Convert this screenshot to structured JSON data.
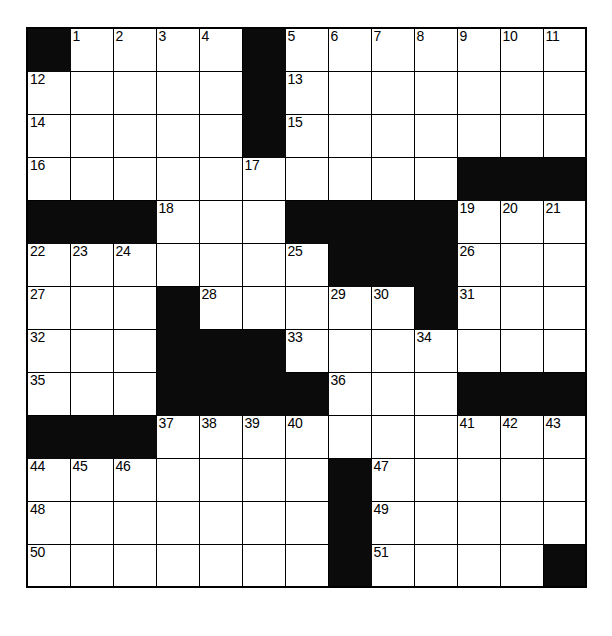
{
  "puzzle": {
    "type": "crossword-grid",
    "columns": 13,
    "rows": 13,
    "cell_size_px": 43,
    "colors": {
      "block": "#0b0b0b",
      "open": "#ffffff",
      "border": "#000000",
      "number_text": "#000000"
    },
    "max_number": 51,
    "numbers_present": [
      1,
      2,
      3,
      4,
      5,
      6,
      7,
      8,
      9,
      10,
      11,
      12,
      13,
      14,
      15,
      16,
      17,
      18,
      19,
      20,
      21,
      22,
      23,
      24,
      25,
      26,
      27,
      28,
      29,
      30,
      31,
      32,
      33,
      34,
      35,
      36,
      37,
      38,
      39,
      40,
      41,
      42,
      43,
      44,
      45,
      46,
      47,
      48,
      49,
      50,
      51
    ],
    "grid": [
      [
        {
          "block": true,
          "num": null
        },
        {
          "block": false,
          "num": "1"
        },
        {
          "block": false,
          "num": "2"
        },
        {
          "block": false,
          "num": "3"
        },
        {
          "block": false,
          "num": "4"
        },
        {
          "block": true,
          "num": null
        },
        {
          "block": false,
          "num": "5"
        },
        {
          "block": false,
          "num": "6"
        },
        {
          "block": false,
          "num": "7"
        },
        {
          "block": false,
          "num": "8"
        },
        {
          "block": false,
          "num": "9"
        },
        {
          "block": false,
          "num": "10"
        },
        {
          "block": false,
          "num": "11"
        }
      ],
      [
        {
          "block": false,
          "num": "12"
        },
        {
          "block": false,
          "num": null
        },
        {
          "block": false,
          "num": null
        },
        {
          "block": false,
          "num": null
        },
        {
          "block": false,
          "num": null
        },
        {
          "block": true,
          "num": null
        },
        {
          "block": false,
          "num": "13"
        },
        {
          "block": false,
          "num": null
        },
        {
          "block": false,
          "num": null
        },
        {
          "block": false,
          "num": null
        },
        {
          "block": false,
          "num": null
        },
        {
          "block": false,
          "num": null
        },
        {
          "block": false,
          "num": null
        }
      ],
      [
        {
          "block": false,
          "num": "14"
        },
        {
          "block": false,
          "num": null
        },
        {
          "block": false,
          "num": null
        },
        {
          "block": false,
          "num": null
        },
        {
          "block": false,
          "num": null
        },
        {
          "block": true,
          "num": null
        },
        {
          "block": false,
          "num": "15"
        },
        {
          "block": false,
          "num": null
        },
        {
          "block": false,
          "num": null
        },
        {
          "block": false,
          "num": null
        },
        {
          "block": false,
          "num": null
        },
        {
          "block": false,
          "num": null
        },
        {
          "block": false,
          "num": null
        }
      ],
      [
        {
          "block": false,
          "num": "16"
        },
        {
          "block": false,
          "num": null
        },
        {
          "block": false,
          "num": null
        },
        {
          "block": false,
          "num": null
        },
        {
          "block": false,
          "num": null
        },
        {
          "block": false,
          "num": "17"
        },
        {
          "block": false,
          "num": null
        },
        {
          "block": false,
          "num": null
        },
        {
          "block": false,
          "num": null
        },
        {
          "block": false,
          "num": null
        },
        {
          "block": true,
          "num": null
        },
        {
          "block": true,
          "num": null
        },
        {
          "block": true,
          "num": null
        }
      ],
      [
        {
          "block": true,
          "num": null
        },
        {
          "block": true,
          "num": null
        },
        {
          "block": true,
          "num": null
        },
        {
          "block": false,
          "num": "18"
        },
        {
          "block": false,
          "num": null
        },
        {
          "block": false,
          "num": null
        },
        {
          "block": true,
          "num": null
        },
        {
          "block": true,
          "num": null
        },
        {
          "block": true,
          "num": null
        },
        {
          "block": true,
          "num": null
        },
        {
          "block": false,
          "num": "19"
        },
        {
          "block": false,
          "num": "20"
        },
        {
          "block": false,
          "num": "21"
        }
      ],
      [
        {
          "block": false,
          "num": "22"
        },
        {
          "block": false,
          "num": "23"
        },
        {
          "block": false,
          "num": "24"
        },
        {
          "block": false,
          "num": null
        },
        {
          "block": false,
          "num": null
        },
        {
          "block": false,
          "num": null
        },
        {
          "block": false,
          "num": "25"
        },
        {
          "block": true,
          "num": null
        },
        {
          "block": true,
          "num": null
        },
        {
          "block": true,
          "num": null
        },
        {
          "block": false,
          "num": "26"
        },
        {
          "block": false,
          "num": null
        },
        {
          "block": false,
          "num": null
        }
      ],
      [
        {
          "block": false,
          "num": "27"
        },
        {
          "block": false,
          "num": null
        },
        {
          "block": false,
          "num": null
        },
        {
          "block": true,
          "num": null
        },
        {
          "block": false,
          "num": "28"
        },
        {
          "block": false,
          "num": null
        },
        {
          "block": false,
          "num": null
        },
        {
          "block": false,
          "num": "29"
        },
        {
          "block": false,
          "num": "30"
        },
        {
          "block": true,
          "num": null
        },
        {
          "block": false,
          "num": "31"
        },
        {
          "block": false,
          "num": null
        },
        {
          "block": false,
          "num": null
        }
      ],
      [
        {
          "block": false,
          "num": "32"
        },
        {
          "block": false,
          "num": null
        },
        {
          "block": false,
          "num": null
        },
        {
          "block": true,
          "num": null
        },
        {
          "block": true,
          "num": null
        },
        {
          "block": true,
          "num": null
        },
        {
          "block": false,
          "num": "33"
        },
        {
          "block": false,
          "num": null
        },
        {
          "block": false,
          "num": null
        },
        {
          "block": false,
          "num": "34"
        },
        {
          "block": false,
          "num": null
        },
        {
          "block": false,
          "num": null
        },
        {
          "block": false,
          "num": null
        }
      ],
      [
        {
          "block": false,
          "num": "35"
        },
        {
          "block": false,
          "num": null
        },
        {
          "block": false,
          "num": null
        },
        {
          "block": true,
          "num": null
        },
        {
          "block": true,
          "num": null
        },
        {
          "block": true,
          "num": null
        },
        {
          "block": true,
          "num": null
        },
        {
          "block": false,
          "num": "36"
        },
        {
          "block": false,
          "num": null
        },
        {
          "block": false,
          "num": null
        },
        {
          "block": true,
          "num": null
        },
        {
          "block": true,
          "num": null
        },
        {
          "block": true,
          "num": null
        }
      ],
      [
        {
          "block": true,
          "num": null
        },
        {
          "block": true,
          "num": null
        },
        {
          "block": true,
          "num": null
        },
        {
          "block": false,
          "num": "37"
        },
        {
          "block": false,
          "num": "38"
        },
        {
          "block": false,
          "num": "39"
        },
        {
          "block": false,
          "num": "40"
        },
        {
          "block": false,
          "num": null
        },
        {
          "block": false,
          "num": null
        },
        {
          "block": false,
          "num": null
        },
        {
          "block": false,
          "num": "41"
        },
        {
          "block": false,
          "num": "42"
        },
        {
          "block": false,
          "num": "43"
        }
      ],
      [
        {
          "block": false,
          "num": "44"
        },
        {
          "block": false,
          "num": "45"
        },
        {
          "block": false,
          "num": "46"
        },
        {
          "block": false,
          "num": null
        },
        {
          "block": false,
          "num": null
        },
        {
          "block": false,
          "num": null
        },
        {
          "block": false,
          "num": null
        },
        {
          "block": true,
          "num": null
        },
        {
          "block": false,
          "num": "47"
        },
        {
          "block": false,
          "num": null
        },
        {
          "block": false,
          "num": null
        },
        {
          "block": false,
          "num": null
        },
        {
          "block": false,
          "num": null
        }
      ],
      [
        {
          "block": false,
          "num": "48"
        },
        {
          "block": false,
          "num": null
        },
        {
          "block": false,
          "num": null
        },
        {
          "block": false,
          "num": null
        },
        {
          "block": false,
          "num": null
        },
        {
          "block": false,
          "num": null
        },
        {
          "block": false,
          "num": null
        },
        {
          "block": true,
          "num": null
        },
        {
          "block": false,
          "num": "49"
        },
        {
          "block": false,
          "num": null
        },
        {
          "block": false,
          "num": null
        },
        {
          "block": false,
          "num": null
        },
        {
          "block": false,
          "num": null
        }
      ],
      [
        {
          "block": false,
          "num": "50"
        },
        {
          "block": false,
          "num": null
        },
        {
          "block": false,
          "num": null
        },
        {
          "block": false,
          "num": null
        },
        {
          "block": false,
          "num": null
        },
        {
          "block": false,
          "num": null
        },
        {
          "block": false,
          "num": null
        },
        {
          "block": true,
          "num": null
        },
        {
          "block": false,
          "num": "51"
        },
        {
          "block": false,
          "num": null
        },
        {
          "block": false,
          "num": null
        },
        {
          "block": false,
          "num": null
        },
        {
          "block": true,
          "num": null
        }
      ]
    ]
  }
}
